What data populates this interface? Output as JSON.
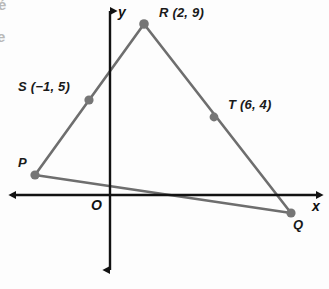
{
  "figure": {
    "background_color": "#fdfdfd",
    "line_color": "#6e6e6e",
    "axis_color": "#121212",
    "point_color": "#767676",
    "text_color": "#141414"
  },
  "axes": {
    "x_label": "x",
    "y_label": "y",
    "origin_label": "O",
    "origin_pixel": {
      "x": 110,
      "y": 195
    },
    "unit_px_x": 17,
    "unit_px_y": 19,
    "x_axis_pixel_y": 195,
    "y_axis_pixel_x": 110,
    "x_arrow_left_px": 10,
    "x_arrow_right_px": 322,
    "y_arrow_top_px": 5,
    "y_arrow_bottom_px": 276,
    "grid": false
  },
  "chart_data": {
    "type": "scatter",
    "title": "",
    "xlabel": "x",
    "ylabel": "y",
    "grid": false,
    "legend": "none",
    "xlim": [
      -6,
      12.5
    ],
    "ylim": [
      -4.2,
      10
    ],
    "points": [
      {
        "name": "P",
        "label": "P",
        "x": -4.4,
        "y": 1.05,
        "px": 35,
        "py": 175,
        "label_px": 18,
        "label_py": 155,
        "show_coords": false
      },
      {
        "name": "R",
        "label": "R (2, 9)",
        "x": 2,
        "y": 9,
        "px": 144,
        "py": 24,
        "label_px": 159,
        "label_py": 5,
        "show_coords": true
      },
      {
        "name": "Q",
        "label": "Q",
        "x": 10.6,
        "y": -0.95,
        "px": 291,
        "py": 213,
        "label_px": 293,
        "label_py": 217,
        "show_coords": false
      },
      {
        "name": "S",
        "label": "S (−1, 5)",
        "x": -1,
        "y": 5,
        "px": 89,
        "py": 100,
        "label_px": 18,
        "label_py": 79,
        "show_coords": true
      },
      {
        "name": "T",
        "label": "T (6, 4)",
        "x": 6,
        "y": 4,
        "px": 214,
        "py": 117,
        "label_px": 228,
        "label_py": 97,
        "show_coords": true
      }
    ],
    "segments": [
      {
        "name": "PR",
        "from": "P",
        "to": "R",
        "from_px": [
          35,
          175
        ],
        "to_px": [
          144,
          24
        ],
        "contains": "S"
      },
      {
        "name": "RQ",
        "from": "R",
        "to": "Q",
        "from_px": [
          144,
          24
        ],
        "to_px": [
          291,
          213
        ],
        "contains": "T"
      },
      {
        "name": "PQ",
        "from": "P",
        "to": "Q",
        "from_px": [
          35,
          175
        ],
        "to_px": [
          291,
          213
        ],
        "contains": ""
      }
    ]
  },
  "artifacts": {
    "top_left_fragment": "é",
    "left_fragment": "e"
  }
}
